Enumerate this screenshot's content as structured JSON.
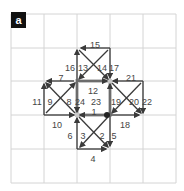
{
  "panel": {
    "label": "a"
  },
  "grid": {
    "x": [
      11,
      44,
      77,
      110,
      143,
      176
    ],
    "y": [
      14,
      48,
      81,
      115,
      149,
      183
    ],
    "color": "#d4d4d4"
  },
  "colors": {
    "arrow": "#3a3a3a",
    "highlight": "#c8c8c8",
    "text": "#444444",
    "node": "#222222"
  },
  "edges": [
    {
      "id": "1",
      "x1": 107,
      "y1": 115,
      "x2": 80,
      "y2": 115,
      "lx": 94,
      "ly": 112
    },
    {
      "id": "2",
      "x1": 108,
      "y1": 117,
      "x2": 80,
      "y2": 147,
      "lx": 102,
      "ly": 136
    },
    {
      "id": "3",
      "x1": 79,
      "y1": 117,
      "x2": 108,
      "y2": 147,
      "lx": 83,
      "ly": 136
    },
    {
      "id": "4",
      "x1": 77,
      "y1": 149,
      "x2": 106,
      "y2": 149,
      "lx": 93,
      "ly": 159
    },
    {
      "id": "5",
      "x1": 110,
      "y1": 115,
      "x2": 110,
      "y2": 146,
      "lx": 114,
      "ly": 136
    },
    {
      "id": "6",
      "x1": 77,
      "y1": 149,
      "x2": 77,
      "y2": 118,
      "lx": 70,
      "ly": 136
    },
    {
      "id": "7",
      "x1": 74,
      "y1": 81,
      "x2": 47,
      "y2": 81,
      "lx": 61,
      "ly": 78
    },
    {
      "id": "8",
      "x1": 46,
      "y1": 113,
      "x2": 75,
      "y2": 83,
      "lx": 69,
      "ly": 102
    },
    {
      "id": "9",
      "x1": 75,
      "y1": 113,
      "x2": 46,
      "y2": 83,
      "lx": 50,
      "ly": 102
    },
    {
      "id": "10",
      "x1": 44,
      "y1": 115,
      "x2": 74,
      "y2": 115,
      "lx": 57,
      "ly": 125
    },
    {
      "id": "11",
      "x1": 44,
      "y1": 115,
      "x2": 44,
      "y2": 84,
      "lx": 37,
      "ly": 102
    },
    {
      "id": "12",
      "x1": 78,
      "y1": 81,
      "x2": 107,
      "y2": 81,
      "lx": 93,
      "ly": 91
    },
    {
      "id": "13",
      "x1": 108,
      "y1": 50,
      "x2": 79,
      "y2": 79,
      "lx": 83,
      "ly": 68
    },
    {
      "id": "14",
      "x1": 79,
      "y1": 50,
      "x2": 108,
      "y2": 79,
      "lx": 102,
      "ly": 68
    },
    {
      "id": "15",
      "x1": 110,
      "y1": 48,
      "x2": 81,
      "y2": 48,
      "lx": 95,
      "ly": 45
    },
    {
      "id": "16",
      "x1": 77,
      "y1": 81,
      "x2": 77,
      "y2": 50,
      "lx": 70,
      "ly": 68
    },
    {
      "id": "17",
      "x1": 110,
      "y1": 48,
      "x2": 110,
      "y2": 78,
      "lx": 114,
      "ly": 68
    },
    {
      "id": "18",
      "x1": 111,
      "y1": 115,
      "x2": 139,
      "y2": 115,
      "lx": 125,
      "ly": 125
    },
    {
      "id": "19",
      "x1": 141,
      "y1": 83,
      "x2": 112,
      "y2": 113,
      "lx": 116,
      "ly": 102
    },
    {
      "id": "20",
      "x1": 112,
      "y1": 83,
      "x2": 141,
      "y2": 113,
      "lx": 134,
      "ly": 102
    },
    {
      "id": "21",
      "x1": 143,
      "y1": 81,
      "x2": 113,
      "y2": 81,
      "lx": 131,
      "ly": 78
    },
    {
      "id": "22",
      "x1": 143,
      "y1": 81,
      "x2": 143,
      "y2": 113,
      "lx": 147,
      "ly": 102
    },
    {
      "id": "23",
      "x1": 110,
      "y1": 115,
      "x2": 110,
      "y2": 84,
      "lx": 96,
      "ly": 102
    },
    {
      "id": "24",
      "x1": 77,
      "y1": 81,
      "x2": 77,
      "y2": 112,
      "lx": 80,
      "ly": 102
    }
  ],
  "highlight_square": {
    "x": 77,
    "y": 81,
    "w": 33,
    "h": 34
  },
  "node": {
    "cx": 107,
    "cy": 115,
    "r": 3
  }
}
